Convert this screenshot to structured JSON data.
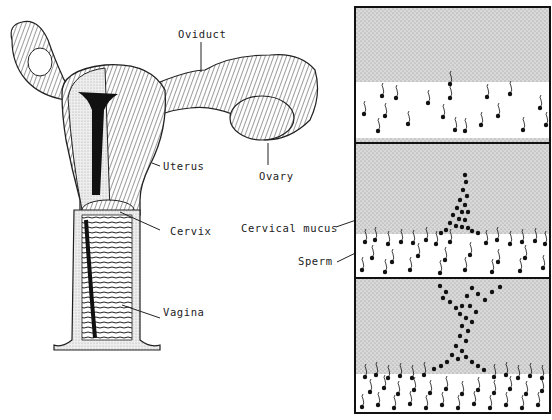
{
  "figure": {
    "left_panel": {
      "title": "Female reproductive tract (cutaway)",
      "labels": {
        "oviduct": "Oviduct",
        "uterus": "Uterus",
        "ovary": "Ovary",
        "cervix": "Cervix",
        "vagina": "Vagina"
      }
    },
    "right_panels": {
      "labels": {
        "cervical_mucus": "Cervical mucus",
        "sperm": "Sperm"
      },
      "panels": [
        {
          "stage": "sperm dispersed below mucus boundary"
        },
        {
          "stage": "sperm forming a single channel into mucus"
        },
        {
          "stage": "sperm channel branching through mucus"
        }
      ]
    },
    "colors": {
      "ink": "#111111",
      "mucus_stipple": "#cfcfcf",
      "background": "#ffffff"
    }
  }
}
